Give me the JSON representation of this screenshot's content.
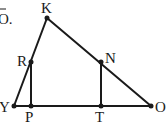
{
  "caption_fragment": "O.",
  "points": {
    "K": {
      "label": "K",
      "x": 47,
      "y": 18
    },
    "R": {
      "label": "R",
      "x": 30,
      "y": 62
    },
    "Y": {
      "label": "Y",
      "x": 14,
      "y": 106
    },
    "P": {
      "label": "P",
      "x": 31,
      "y": 106
    },
    "T": {
      "label": "T",
      "x": 101,
      "y": 106
    },
    "N": {
      "label": "N",
      "x": 101,
      "y": 62
    },
    "O": {
      "label": "O",
      "x": 151,
      "y": 106
    }
  },
  "segments": [
    [
      "Y",
      "K"
    ],
    [
      "K",
      "O"
    ],
    [
      "Y",
      "O"
    ],
    [
      "R",
      "P"
    ],
    [
      "N",
      "T"
    ]
  ],
  "colors": {
    "ink": "#1a1a1a",
    "background": "#ffffff"
  }
}
